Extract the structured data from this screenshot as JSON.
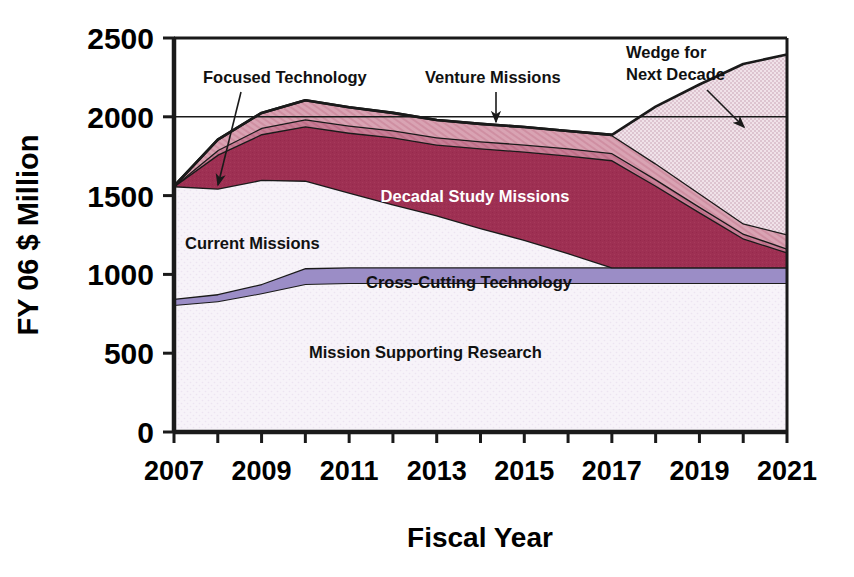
{
  "chart_data": {
    "type": "area",
    "title": "",
    "xlabel": "Fiscal Year",
    "ylabel": "FY 06 $ Million",
    "xlim": [
      2007,
      2021
    ],
    "ylim": [
      0,
      2500
    ],
    "ytick_labels": [
      "2500",
      "2000",
      "1500",
      "1000",
      "500",
      "0"
    ],
    "ytick_values": [
      2500,
      2000,
      1500,
      1000,
      500,
      0
    ],
    "xtick_labels": [
      "2007",
      "2009",
      "2011",
      "2013",
      "2015",
      "2017",
      "2019",
      "2021"
    ],
    "xtick_values": [
      2007,
      2009,
      2011,
      2013,
      2015,
      2017,
      2019,
      2021
    ],
    "x": [
      2007,
      2008,
      2009,
      2010,
      2011,
      2012,
      2013,
      2014,
      2015,
      2016,
      2017,
      2018,
      2019,
      2020,
      2021
    ],
    "grid": "major-horizontal-2000-2500",
    "legend_position": "inline-annotations",
    "stacked": true,
    "series": [
      {
        "name": "Mission Supporting Research",
        "color": "#f4f0f7",
        "values": [
          805,
          830,
          880,
          940,
          945,
          945,
          945,
          945,
          945,
          945,
          945,
          945,
          945,
          945,
          945
        ]
      },
      {
        "name": "Cross-Cutting Technology",
        "color": "#9b8dc6",
        "values": [
          40,
          45,
          60,
          100,
          100,
          100,
          100,
          100,
          100,
          100,
          100,
          100,
          100,
          100,
          100
        ]
      },
      {
        "name": "Current Missions",
        "color": "#f4f0f7",
        "values": [
          715,
          670,
          660,
          555,
          475,
          400,
          330,
          250,
          175,
          90,
          0,
          0,
          0,
          0,
          0
        ]
      },
      {
        "name": "Decadal Study Missions",
        "color": "#9e3053",
        "values": [
          0,
          215,
          290,
          345,
          380,
          425,
          450,
          505,
          560,
          620,
          680,
          520,
          350,
          185,
          95
        ]
      },
      {
        "name": "Venture Missions",
        "color": "#c9768f",
        "values": [
          0,
          30,
          40,
          45,
          45,
          45,
          45,
          45,
          45,
          45,
          45,
          40,
          35,
          30,
          25
        ]
      },
      {
        "name": "Focused Technology",
        "color": "#d79aac",
        "values": [
          0,
          65,
          95,
          120,
          115,
          110,
          110,
          110,
          110,
          110,
          115,
          100,
          85,
          65,
          90
        ]
      },
      {
        "name": "Wedge for Next Decade",
        "color": "#e9d7e0",
        "values": [
          0,
          0,
          0,
          0,
          0,
          0,
          0,
          0,
          0,
          0,
          0,
          360,
          690,
          1010,
          1140
        ]
      }
    ],
    "annotations": [
      {
        "id": "focused-technology",
        "label": "Focused Technology",
        "has_arrow": true
      },
      {
        "id": "venture-missions",
        "label": "Venture Missions",
        "has_arrow": true
      },
      {
        "id": "wedge-for-next-decade",
        "label": "Wedge for\nNext Decade",
        "line1": "Wedge for",
        "line2": "Next Decade",
        "has_arrow": true
      },
      {
        "id": "decadal-study-missions",
        "label": "Decadal Study Missions",
        "has_arrow": false
      },
      {
        "id": "current-missions",
        "label": "Current Missions",
        "has_arrow": false
      },
      {
        "id": "cross-cutting-technology",
        "label": "Cross-Cutting Technology",
        "has_arrow": false
      },
      {
        "id": "mission-supporting-research",
        "label": "Mission Supporting Research",
        "has_arrow": false
      }
    ]
  },
  "colors": {
    "axis": "#000000",
    "dark_red": "#9e3053",
    "mid_pink": "#c9768f",
    "light_pink": "#d79aac",
    "wedge_pink": "#e9d7e0",
    "purple": "#9b8dc6",
    "pale": "#f4f0f7",
    "background": "#ffffff"
  }
}
